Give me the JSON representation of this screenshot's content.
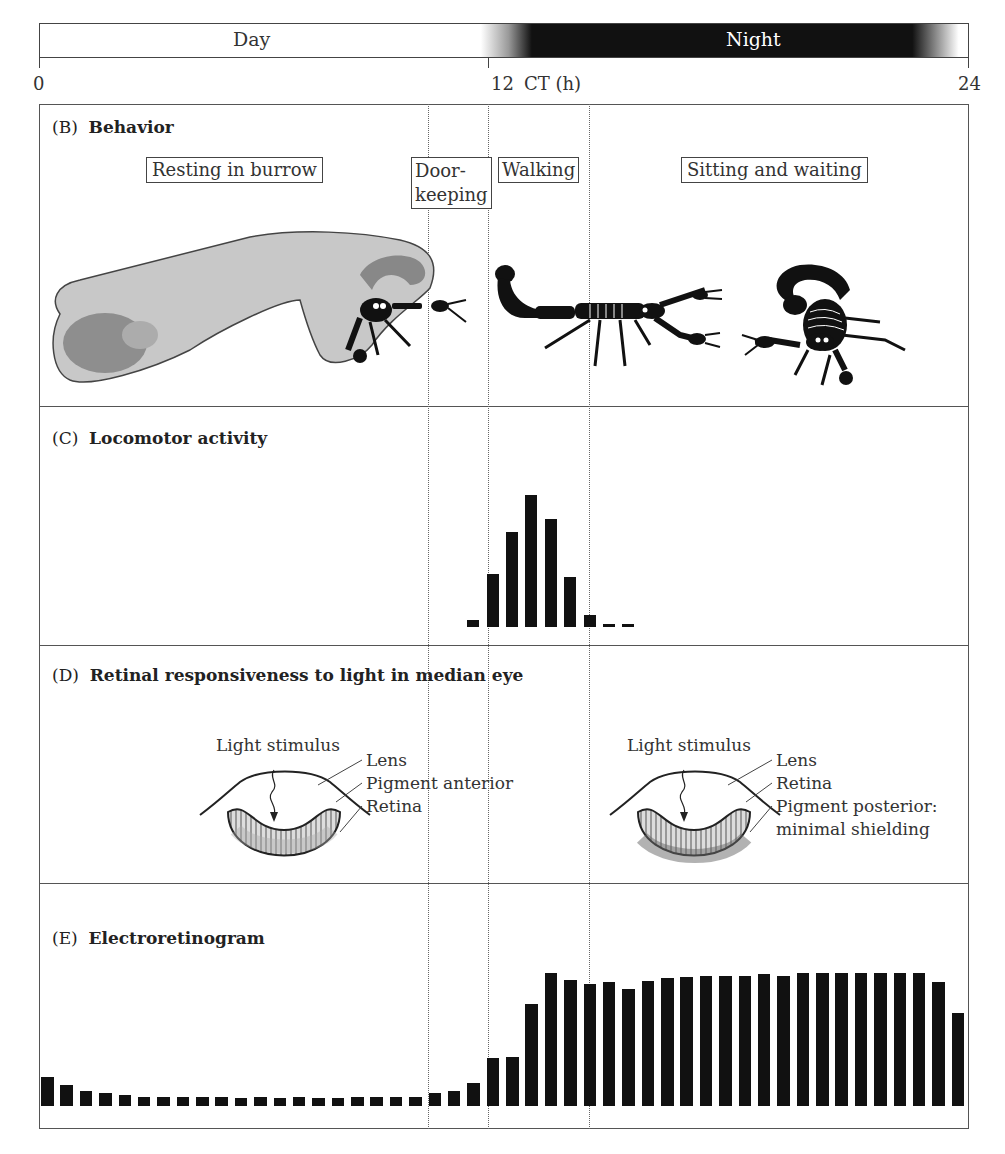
{
  "timeline": {
    "day_label": "Day",
    "night_label": "Night",
    "axis_label": "CT (h)",
    "ticks": [
      {
        "label": "0",
        "x": 39
      },
      {
        "label": "12",
        "x": 488
      },
      {
        "label": "24",
        "x": 969
      }
    ]
  },
  "panels": {
    "behavior": {
      "letter": "(B)",
      "title": "Behavior",
      "phases": [
        {
          "label": "Resting in burrow"
        },
        {
          "label": "Door-",
          "label2": "keeping"
        },
        {
          "label": "Walking"
        },
        {
          "label": "Sitting and waiting"
        }
      ],
      "illustrations": [
        "scorpion-in-burrow",
        "scorpion-walking",
        "scorpion-sitting"
      ]
    },
    "locomotor": {
      "letter": "(C)",
      "title": "Locomotor activity"
    },
    "retina": {
      "letter": "(D)",
      "title": "Retinal responsiveness to light in median eye",
      "day_eye": {
        "stimulus": "Light stimulus",
        "labels": [
          "Lens",
          "Pigment anterior",
          "Retina"
        ]
      },
      "night_eye": {
        "stimulus": "Light stimulus",
        "labels": [
          "Lens",
          "Retina",
          "Pigment posterior:",
          "minimal shielding"
        ]
      }
    },
    "erg": {
      "letter": "(E)",
      "title": "Electroretinogram"
    }
  },
  "phase_boundaries_ct": [
    11,
    12,
    14.2
  ],
  "colors": {
    "bar": "#111111",
    "burrow": "#c8c8c8",
    "frame": "#555555"
  },
  "chart_data": [
    {
      "type": "bar",
      "title": "Locomotor activity",
      "xlabel": "CT (h)",
      "ylabel": "",
      "x": [
        11.0,
        11.5,
        12.0,
        12.5,
        13.0,
        13.5,
        14.0,
        14.5,
        15.0
      ],
      "values": [
        5,
        40,
        72,
        100,
        82,
        38,
        9,
        1,
        1
      ],
      "ylim": [
        0,
        100
      ],
      "grid": false
    },
    {
      "type": "bar",
      "title": "Electroretinogram",
      "xlabel": "CT (h)",
      "ylabel": "",
      "x": [
        0,
        0.5,
        1,
        1.5,
        2,
        2.5,
        3,
        3.5,
        4,
        4.5,
        5,
        5.5,
        6,
        6.5,
        7,
        7.5,
        8,
        8.5,
        9,
        9.5,
        10,
        10.5,
        11,
        11.5,
        12,
        12.5,
        13,
        13.5,
        14,
        14.5,
        15,
        15.5,
        16,
        16.5,
        17,
        17.5,
        18,
        18.5,
        19,
        19.5,
        20,
        20.5,
        21,
        21.5,
        22,
        22.5,
        23,
        23.5
      ],
      "values": [
        22,
        16,
        11,
        10,
        8,
        7,
        7,
        7,
        7,
        7,
        6,
        7,
        6,
        7,
        6,
        6,
        7,
        7,
        7,
        7,
        10,
        11,
        17,
        36,
        37,
        77,
        100,
        95,
        92,
        93,
        88,
        94,
        96,
        97,
        98,
        98,
        98,
        99,
        98,
        100,
        100,
        100,
        100,
        100,
        100,
        100,
        93,
        70
      ],
      "ylim": [
        0,
        100
      ],
      "grid": false
    }
  ]
}
